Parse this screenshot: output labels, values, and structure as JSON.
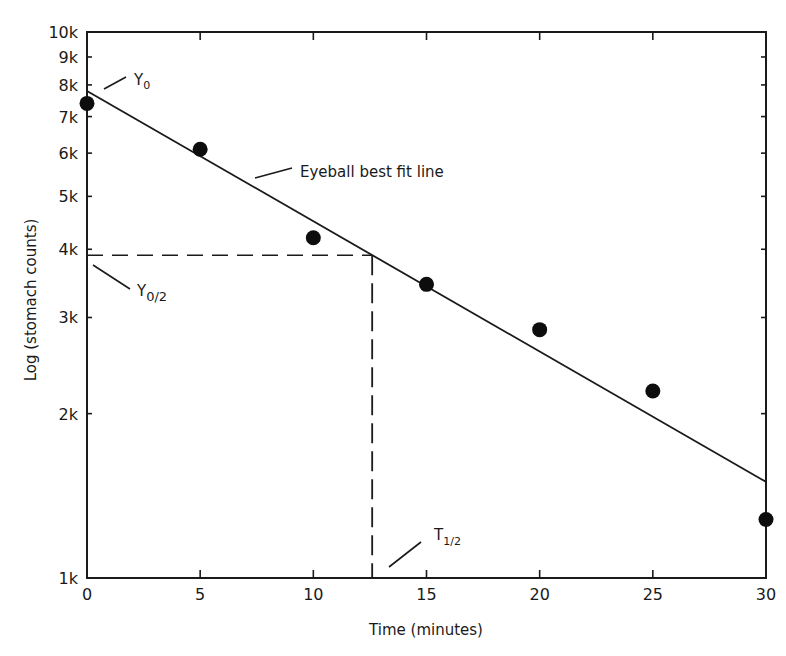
{
  "chart_data": {
    "type": "scatter",
    "title": "",
    "xlabel": "Time (minutes)",
    "ylabel": "Log (stomach counts)",
    "xlim": [
      0,
      30
    ],
    "ylim": [
      1000,
      10000
    ],
    "yscale": "log",
    "grid": false,
    "x_ticks": [
      0,
      5,
      10,
      15,
      20,
      25,
      30
    ],
    "x_tick_labels": [
      "0",
      "5",
      "10",
      "15",
      "20",
      "25",
      "30"
    ],
    "y_ticks": [
      1000,
      2000,
      3000,
      4000,
      5000,
      6000,
      7000,
      8000,
      9000,
      10000
    ],
    "y_tick_labels": [
      "1k",
      "2k",
      "3k",
      "4k",
      "5k",
      "6k",
      "7k",
      "8k",
      "9k",
      "10k"
    ],
    "series": [
      {
        "name": "Stomach counts",
        "marker": "filled-circle",
        "x": [
          0,
          5,
          10,
          15,
          20,
          25,
          30
        ],
        "y": [
          7400,
          6100,
          4200,
          3450,
          2850,
          2200,
          1280
        ]
      },
      {
        "name": "Eyeball best fit line",
        "style": "solid-line",
        "x": [
          0,
          30
        ],
        "y": [
          7800,
          1500
        ]
      }
    ],
    "reference_lines": [
      {
        "name": "half-value",
        "orientation": "horizontal",
        "y": 3900,
        "x_range": [
          0,
          12.6
        ],
        "style": "dashed"
      },
      {
        "name": "half-time",
        "orientation": "vertical",
        "x": 12.6,
        "y_range": [
          1000,
          3900
        ],
        "style": "dashed"
      }
    ],
    "annotations": [
      {
        "text": "Y0",
        "main": "Y",
        "sub": "0",
        "x": 0,
        "y": 7800
      },
      {
        "text": "Eyeball best fit line",
        "x": 8,
        "y": 5800
      },
      {
        "text": "Y0/2",
        "main": "Y",
        "sub": "0/2",
        "x": 0,
        "y": 3900
      },
      {
        "text": "T1/2",
        "main": "T",
        "sub": "1/2",
        "x": 12.6,
        "y": 1000
      }
    ]
  },
  "labels": {
    "xlabel": "Time (minutes)",
    "ylabel": "Log (stomach counts)",
    "fit_line": "Eyeball best fit line",
    "y0_main": "Y",
    "y0_sub": "0",
    "y0half_main": "Y",
    "y0half_sub": "0/2",
    "thalf_main": "T",
    "thalf_sub": "1/2"
  }
}
